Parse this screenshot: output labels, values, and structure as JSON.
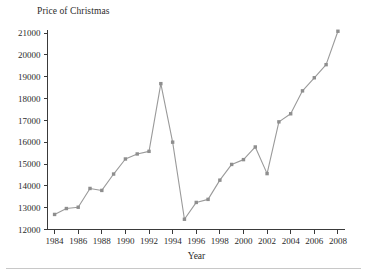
{
  "chart_data": {
    "type": "line",
    "title": "Price of Christmas",
    "xlabel": "Year",
    "ylabel": "",
    "x": [
      1984,
      1985,
      1986,
      1987,
      1988,
      1989,
      1990,
      1991,
      1992,
      1993,
      1994,
      1995,
      1996,
      1997,
      1998,
      1999,
      2000,
      2001,
      2002,
      2003,
      2004,
      2005,
      2006,
      2007,
      2008
    ],
    "values": [
      12690,
      12960,
      13020,
      13880,
      13790,
      14540,
      15230,
      15460,
      15580,
      18680,
      16000,
      12470,
      13240,
      13380,
      14260,
      14980,
      15200,
      15780,
      14560,
      16930,
      17300,
      18350,
      18950,
      19550,
      21080
    ],
    "series": [
      {
        "name": "Price of Christmas",
        "values": [
          12690,
          12960,
          13020,
          13880,
          13790,
          14540,
          15230,
          15460,
          15580,
          18680,
          16000,
          12470,
          13240,
          13380,
          14260,
          14980,
          15200,
          15780,
          14560,
          16930,
          17300,
          18350,
          18950,
          19550,
          21080
        ]
      }
    ],
    "xlim": [
      1983.4,
      2008.6
    ],
    "ylim": [
      12000,
      21000
    ],
    "ytick_labels": [
      "12000",
      "13000",
      "14000",
      "15000",
      "16000",
      "17000",
      "18000",
      "19000",
      "20000",
      "21000"
    ],
    "yticks": [
      12000,
      13000,
      14000,
      15000,
      16000,
      17000,
      18000,
      19000,
      20000,
      21000
    ],
    "xtick_labels": [
      "1984",
      "1986",
      "1988",
      "1990",
      "1992",
      "1994",
      "1996",
      "1998",
      "2000",
      "2002",
      "2004",
      "2006",
      "2008"
    ],
    "xticks": [
      1984,
      1986,
      1988,
      1990,
      1992,
      1994,
      1996,
      1998,
      2000,
      2002,
      2004,
      2006,
      2008
    ],
    "grid": false,
    "legend": false,
    "legend_position": "none",
    "line_color": "#9a9a9a",
    "marker_color": "#8e8e8e",
    "axis_color": "#3a3a3a",
    "background_color": "#ffffff"
  }
}
